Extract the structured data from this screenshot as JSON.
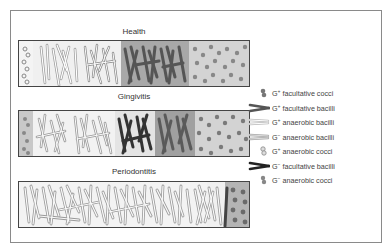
{
  "panels": [
    {
      "title": "Health",
      "zones": [
        "G+ facultative cocci",
        "G+ facultative bacilli",
        "G+ anaerobic bacilli",
        "G- facultative bacilli",
        "G+ anaerobic cocci"
      ]
    },
    {
      "title": "Gingivitis",
      "zones": [
        "G+ facultative cocci",
        "G+ anaerobic bacilli",
        "G- anaerobic bacilli",
        "G- facultative bacilli",
        "G+ facultative bacilli",
        "G+ anaerobic cocci"
      ]
    },
    {
      "title": "Periodontitis",
      "zones": [
        "G+ anaerobic bacilli",
        "G- anaerobic bacilli",
        "G- facultative bacilli",
        "G- anaerobic cocci"
      ]
    }
  ],
  "legend": [
    {
      "icon": "coccus-gray-icon",
      "sign": "+",
      "label": "facultative cocci"
    },
    {
      "icon": "bacillus-dark-icon",
      "sign": "+",
      "label": "facultative bacilli"
    },
    {
      "icon": "bacillus-outline-light-icon",
      "sign": "+",
      "label": "anaerobic bacilli"
    },
    {
      "icon": "bacillus-outline-gray-icon",
      "sign": "−",
      "label": "anaerobic bacilli"
    },
    {
      "icon": "coccus-outline-icon",
      "sign": "+",
      "label": "anaerobic cocci"
    },
    {
      "icon": "bacillus-black-icon",
      "sign": "−",
      "label": "facultative bacilli"
    },
    {
      "icon": "coccus-dark-icon",
      "sign": "−",
      "label": "anaerobic cocci"
    }
  ],
  "colors": {
    "frame": "#8a8a8a",
    "strip_border": "#444444",
    "zone_light": "#f2f2f2",
    "zone_mid": "#bdbdbd",
    "zone_dark": "#9a9a9a",
    "cocci_zone": "#c8c8c8"
  }
}
